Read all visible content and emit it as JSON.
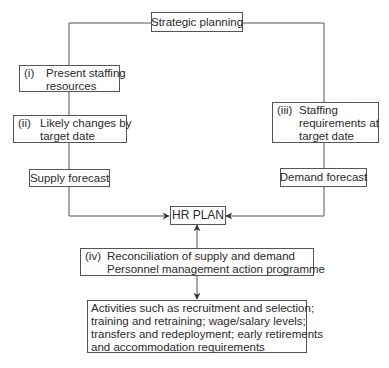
{
  "diagram": {
    "top": {
      "label": "Strategic planning"
    },
    "supply_side": {
      "box_i": {
        "number": "(i)",
        "lines": [
          "Present staffing",
          "resources"
        ]
      },
      "box_ii": {
        "number": "(ii)",
        "lines": [
          "Likely changes by",
          "target date"
        ]
      },
      "forecast": "Supply forecast"
    },
    "demand_side": {
      "box_iii": {
        "number": "(iii)",
        "lines": [
          "Staffing",
          "requirements at",
          "target date"
        ]
      },
      "forecast": "Demand forecast"
    },
    "center": {
      "label": "HR PLAN"
    },
    "reconciliation": {
      "number": "(iv)",
      "lines": [
        "Reconciliation of supply and demand",
        "Personnel management action programme"
      ]
    },
    "activities": {
      "lines": [
        "Activities such as recruitment and selection;",
        "training and retraining; wage/salary levels;",
        "transfers and redeployment; early retirements",
        "and accommodation requirements"
      ]
    },
    "colors": {
      "line": "#555555",
      "text": "#2a2a2a",
      "background": "#ffffff"
    }
  }
}
